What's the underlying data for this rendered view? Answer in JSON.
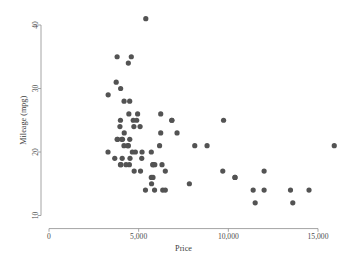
{
  "chart_data": {
    "type": "scatter",
    "title": "",
    "xlabel": "Price",
    "ylabel": "Mileage (mpg)",
    "xlim": [
      0,
      16500
    ],
    "ylim": [
      9.2,
      42
    ],
    "xticks": [
      0,
      5000,
      10000,
      15000
    ],
    "xticklabels": [
      "0",
      "5,000",
      "10,000",
      "15,000"
    ],
    "yticks": [
      10,
      20,
      30,
      40
    ],
    "yticklabels": [
      "10",
      "20",
      "30",
      "40"
    ],
    "grid": false,
    "legend": null,
    "marker_color": "#535353",
    "marker_size": 2.6,
    "axis_color": "#9a9a9a",
    "background_color": "#ffffff",
    "n_points": 74,
    "points": [
      {
        "x": 4099,
        "y": 22
      },
      {
        "x": 4749,
        "y": 17
      },
      {
        "x": 3799,
        "y": 22
      },
      {
        "x": 4816,
        "y": 20
      },
      {
        "x": 7827,
        "y": 15
      },
      {
        "x": 5788,
        "y": 18
      },
      {
        "x": 4453,
        "y": 26
      },
      {
        "x": 5189,
        "y": 20
      },
      {
        "x": 10372,
        "y": 16
      },
      {
        "x": 4082,
        "y": 19
      },
      {
        "x": 11385,
        "y": 14
      },
      {
        "x": 14500,
        "y": 14
      },
      {
        "x": 15906,
        "y": 21
      },
      {
        "x": 3299,
        "y": 29
      },
      {
        "x": 5705,
        "y": 16
      },
      {
        "x": 4504,
        "y": 22
      },
      {
        "x": 5104,
        "y": 17
      },
      {
        "x": 3667,
        "y": 19
      },
      {
        "x": 3955,
        "y": 24
      },
      {
        "x": 3984,
        "y": 25
      },
      {
        "x": 4010,
        "y": 18
      },
      {
        "x": 5886,
        "y": 14
      },
      {
        "x": 6342,
        "y": 14
      },
      {
        "x": 4389,
        "y": 21
      },
      {
        "x": 4187,
        "y": 28
      },
      {
        "x": 11497,
        "y": 12
      },
      {
        "x": 13594,
        "y": 12
      },
      {
        "x": 13466,
        "y": 14
      },
      {
        "x": 3829,
        "y": 22
      },
      {
        "x": 5379,
        "y": 14
      },
      {
        "x": 6165,
        "y": 21
      },
      {
        "x": 4516,
        "y": 19
      },
      {
        "x": 6303,
        "y": 18
      },
      {
        "x": 3291,
        "y": 20
      },
      {
        "x": 8814,
        "y": 21
      },
      {
        "x": 5172,
        "y": 19
      },
      {
        "x": 4733,
        "y": 24
      },
      {
        "x": 4890,
        "y": 25
      },
      {
        "x": 4181,
        "y": 21
      },
      {
        "x": 4195,
        "y": 23
      },
      {
        "x": 10371,
        "y": 16
      },
      {
        "x": 4647,
        "y": 20
      },
      {
        "x": 4425,
        "y": 21
      },
      {
        "x": 4482,
        "y": 18
      },
      {
        "x": 6486,
        "y": 17
      },
      {
        "x": 4060,
        "y": 22
      },
      {
        "x": 3984,
        "y": 18
      },
      {
        "x": 4296,
        "y": 18
      },
      {
        "x": 6850,
        "y": 25
      },
      {
        "x": 5799,
        "y": 18
      },
      {
        "x": 4499,
        "y": 28
      },
      {
        "x": 3995,
        "y": 30
      },
      {
        "x": 3798,
        "y": 35
      },
      {
        "x": 5899,
        "y": 18
      },
      {
        "x": 3748,
        "y": 31
      },
      {
        "x": 5719,
        "y": 15
      },
      {
        "x": 7140,
        "y": 23
      },
      {
        "x": 5397,
        "y": 41
      },
      {
        "x": 4697,
        "y": 25
      },
      {
        "x": 6850,
        "y": 25
      },
      {
        "x": 11995,
        "y": 17
      },
      {
        "x": 9735,
        "y": 25
      },
      {
        "x": 6229,
        "y": 23
      },
      {
        "x": 4589,
        "y": 35
      },
      {
        "x": 5079,
        "y": 24
      },
      {
        "x": 8129,
        "y": 21
      },
      {
        "x": 4424,
        "y": 34
      },
      {
        "x": 6229,
        "y": 26
      },
      {
        "x": 4941,
        "y": 26
      },
      {
        "x": 5705,
        "y": 20
      },
      {
        "x": 5799,
        "y": 16
      },
      {
        "x": 9690,
        "y": 17
      },
      {
        "x": 6486,
        "y": 14
      },
      {
        "x": 11995,
        "y": 14
      }
    ]
  },
  "figure": {
    "name": "scatter-plot-price-mileage"
  }
}
